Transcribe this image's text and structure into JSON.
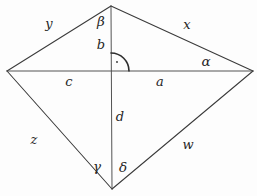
{
  "figure": {
    "stroke_color": "#3a3a3a",
    "background_color": "#fdfdfd",
    "label_color": "#262626",
    "width": 257,
    "height": 196
  },
  "vertices": {
    "top": {
      "name": "top-vertex",
      "x": 111,
      "y": 6
    },
    "left": {
      "name": "left-vertex",
      "x": 7,
      "y": 71
    },
    "right": {
      "name": "right-vertex",
      "x": 253,
      "y": 71
    },
    "bottom": {
      "name": "bottom-vertex",
      "x": 112,
      "y": 189
    },
    "center": {
      "name": "center-intersection",
      "x": 110,
      "y": 71
    }
  },
  "edges": [
    {
      "name": "edge-top-left",
      "label": "y",
      "from": "top",
      "to": "left"
    },
    {
      "name": "edge-top-right",
      "label": "x",
      "from": "top",
      "to": "right"
    },
    {
      "name": "edge-bottom-left",
      "label": "z",
      "from": "left",
      "to": "bottom"
    },
    {
      "name": "edge-bottom-right",
      "label": "w",
      "from": "bottom",
      "to": "right"
    }
  ],
  "diagonals": [
    {
      "name": "diagonal-horizontal",
      "from": "left",
      "to": "right"
    },
    {
      "name": "diagonal-vertical",
      "from": "top",
      "to": "bottom"
    }
  ],
  "segments": [
    {
      "name": "segment-b",
      "label": "b",
      "description": "center to top vertex"
    },
    {
      "name": "segment-c",
      "label": "c",
      "description": "center to left vertex"
    },
    {
      "name": "segment-a",
      "label": "a",
      "description": "center to right vertex"
    },
    {
      "name": "segment-d",
      "label": "d",
      "description": "center to bottom vertex"
    }
  ],
  "angles": [
    {
      "name": "angle-beta",
      "label": "β",
      "description": "at top vertex, left of vertical"
    },
    {
      "name": "angle-alpha",
      "label": "α",
      "description": "at right vertex, above horizontal"
    },
    {
      "name": "angle-gamma",
      "label": "γ",
      "description": "at bottom vertex, left of vertical"
    },
    {
      "name": "angle-delta",
      "label": "δ",
      "description": "at bottom vertex, right of vertical"
    }
  ],
  "markers": [
    {
      "name": "right-angle-marker",
      "description": "arc with dot at diagonal intersection, upper-right quadrant"
    }
  ],
  "labels": [
    {
      "key": "y",
      "text": "y",
      "x": 49,
      "y": 23,
      "kind": "side"
    },
    {
      "key": "x",
      "text": "x",
      "x": 187,
      "y": 24,
      "kind": "side"
    },
    {
      "key": "beta",
      "text": "β",
      "x": 101,
      "y": 22,
      "kind": "greek"
    },
    {
      "key": "b",
      "text": "b",
      "x": 101,
      "y": 44,
      "kind": "side"
    },
    {
      "key": "alpha",
      "text": "α",
      "x": 206,
      "y": 62,
      "kind": "greek"
    },
    {
      "key": "c",
      "text": "c",
      "x": 69,
      "y": 81,
      "kind": "side"
    },
    {
      "key": "a",
      "text": "a",
      "x": 160,
      "y": 81,
      "kind": "side"
    },
    {
      "key": "d",
      "text": "d",
      "x": 120,
      "y": 116,
      "kind": "side"
    },
    {
      "key": "z",
      "text": "z",
      "x": 34,
      "y": 139,
      "kind": "side"
    },
    {
      "key": "w",
      "text": "w",
      "x": 188,
      "y": 144,
      "kind": "side"
    },
    {
      "key": "gamma",
      "text": "γ",
      "x": 97,
      "y": 167,
      "kind": "greek"
    },
    {
      "key": "delta",
      "text": "δ",
      "x": 123,
      "y": 168,
      "kind": "greek"
    }
  ]
}
